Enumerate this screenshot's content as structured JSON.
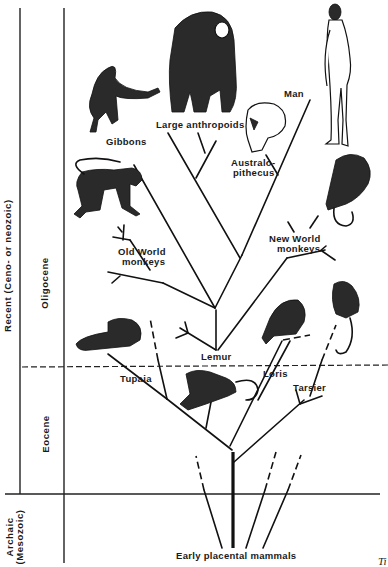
{
  "diagram": {
    "eras": [
      {
        "label": "Recent   (Ceno- or neozoic)"
      },
      {
        "label_line1": "Archaic",
        "label_line2": "(Mesozoic)"
      }
    ],
    "epochs": [
      {
        "label": "Oligocene"
      },
      {
        "label": "Eocene"
      }
    ],
    "taxa": {
      "man": "Man",
      "large_anthropoids": "Large anthropoids",
      "gibbons": "Gibbons",
      "australopithecus_line1": "Australo-",
      "australopithecus_line2": "pithecus",
      "old_world_line1": "Old World",
      "old_world_line2": "monkeys",
      "new_world_line1": "New World",
      "new_world_line2": "monkeys",
      "lemur": "Lemur",
      "loris": "Loris",
      "tupaia": "Tupaia",
      "tarsier": "Tarsier",
      "early_placental": "Early placental mammals"
    },
    "caption_fragment": "Ti"
  }
}
